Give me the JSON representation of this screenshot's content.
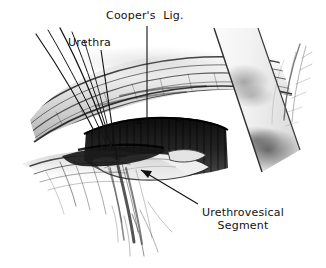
{
  "figure": {
    "kind": "anatomical-surgical-illustration",
    "style": "black-and-white pen-and-ink / stipple medical drawing",
    "background_color": "#ffffff",
    "ink_color": "#111111",
    "width": 326,
    "height": 268
  },
  "labels": [
    {
      "id": "coopers",
      "text": "Cooper's  Lig.",
      "x": 106,
      "y": 9,
      "leader": "vertical line descending to the fibrous ligament band"
    },
    {
      "id": "urethra",
      "text": "Urethra",
      "x": 68,
      "y": 36,
      "leader": "line angling down and to the right toward the urethral tube"
    },
    {
      "id": "urethrovesical",
      "line1": "Urethrovesical",
      "line2": "Segment",
      "x": 191,
      "y": 206,
      "leader": "arrow pointing up and to the left at the pale tissue shelf"
    }
  ],
  "anatomy": {
    "coopers_ligament": "horizontally striated fibrous band across the upper third",
    "retropubic_space": "dark vertically striated cavity in the centre",
    "urethrovesical_segment": "pale rounded tissue shelf below the cavity",
    "retractor": "broad pale band sweeping down to the right",
    "sutures": "five fine threads fanning from the upper left into the tissue"
  },
  "colors": {
    "paper": "#ffffff",
    "ink": "#111111",
    "deep_shadow": "#1a1a1a",
    "mid_gray": "#8d8d8d",
    "light_gray": "#cfcfcf",
    "retractor_fill": "#f4f4f4"
  }
}
